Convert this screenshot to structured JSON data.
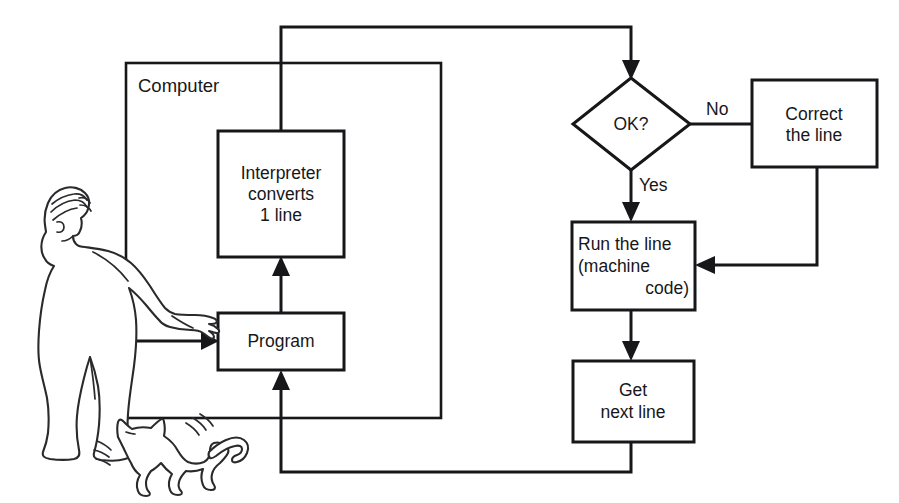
{
  "diagram": {
    "title_text": "",
    "container": {
      "label": "Computer"
    },
    "nodes": {
      "interpreter": {
        "line1": "Interpreter",
        "line2": "converts",
        "line3": "1 line"
      },
      "program": {
        "label": "Program"
      },
      "decision": {
        "label": "OK?"
      },
      "correct": {
        "line1": "Correct",
        "line2": "the line"
      },
      "run": {
        "line1": "Run the line",
        "line2": "(machine",
        "line3": "code)"
      },
      "getnext": {
        "line1": "Get",
        "line2": "next line"
      }
    },
    "edge_labels": {
      "no": "No",
      "yes": "Yes"
    },
    "illustration": {
      "person": "person-figure",
      "cat": "cat-figure"
    },
    "colors": {
      "ink": "#17171a",
      "paper": "#ffffff",
      "figure_ink": "#2a2a2d"
    }
  }
}
